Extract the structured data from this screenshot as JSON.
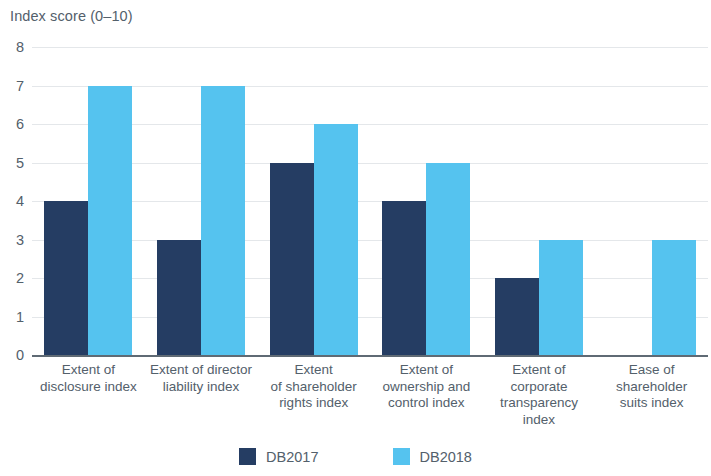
{
  "chart_data": {
    "type": "bar",
    "title": "",
    "subtitle": "",
    "xlabel": "",
    "ylabel": "Index score (0–10)",
    "ylim": [
      0,
      8
    ],
    "ytick_labels": [
      "0",
      "1",
      "2",
      "3",
      "4",
      "5",
      "6",
      "7",
      "8"
    ],
    "yticks": [
      0,
      1,
      2,
      3,
      4,
      5,
      6,
      7,
      8
    ],
    "grid": true,
    "legend_position": "bottom",
    "categories": [
      "Extent of\ndisclosure index",
      "Extent of director\nliability index",
      "Extent\nof shareholder\nrights index",
      "Extent of\nownership and\ncontrol index",
      "Extent of\ncorporate\ntransparency\nindex",
      "Ease of\nshareholder\nsuits index"
    ],
    "series": [
      {
        "name": "DB2017",
        "color": "#253d63",
        "values": [
          4,
          3,
          5,
          4,
          2,
          0
        ]
      },
      {
        "name": "DB2018",
        "color": "#55c3ef",
        "values": [
          7,
          7,
          6,
          5,
          3,
          3
        ]
      }
    ]
  },
  "legend": {
    "items": [
      {
        "label": "DB2017",
        "color": "#253d63"
      },
      {
        "label": "DB2018",
        "color": "#55c3ef"
      }
    ]
  }
}
